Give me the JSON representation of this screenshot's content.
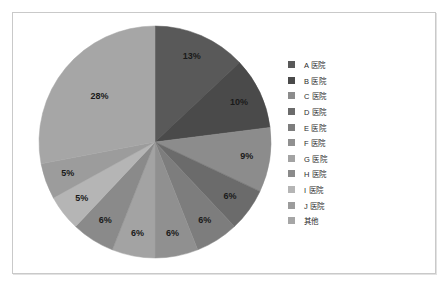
{
  "frame": {
    "border_color": "#c9c9c9",
    "background": "#ffffff"
  },
  "legend": {
    "position": "right",
    "items": [
      {
        "label": "A 医院",
        "color": "#595959"
      },
      {
        "label": "B 医院",
        "color": "#4a4a4a"
      },
      {
        "label": "C 医院",
        "color": "#8c8c8c"
      },
      {
        "label": "D 医院",
        "color": "#6b6b6b"
      },
      {
        "label": "E 医院",
        "color": "#7d7d7d"
      },
      {
        "label": "F 医院",
        "color": "#909090"
      },
      {
        "label": "G 医院",
        "color": "#a3a3a3"
      },
      {
        "label": "H 医院",
        "color": "#8a8a8a"
      },
      {
        "label": "I 医院",
        "color": "#b5b5b5"
      },
      {
        "label": "J 医院",
        "color": "#9c9c9c"
      },
      {
        "label": "其他",
        "color": "#a6a6a6"
      }
    ]
  },
  "chart_data": {
    "type": "pie",
    "title": "",
    "subtitle": "",
    "xlabel": "",
    "ylabel": "",
    "grid": false,
    "legend_position": "right",
    "start_angle_deg": 0,
    "direction": "clockwise",
    "value_unit": "%",
    "categories": [
      "A 医院",
      "B 医院",
      "C 医院",
      "D 医院",
      "E 医院",
      "F 医院",
      "G 医院",
      "H 医院",
      "I 医院",
      "J 医院",
      "其他"
    ],
    "values": [
      13,
      10,
      9,
      6,
      6,
      6,
      6,
      6,
      5,
      5,
      28
    ],
    "data_labels": [
      "13%",
      "10%",
      "9%",
      "6%",
      "6%",
      "6%",
      "6%",
      "6%",
      "5%",
      "5%",
      "28%"
    ],
    "colors": [
      "#595959",
      "#4a4a4a",
      "#8c8c8c",
      "#6b6b6b",
      "#7d7d7d",
      "#909090",
      "#a3a3a3",
      "#8a8a8a",
      "#b5b5b5",
      "#9c9c9c",
      "#a6a6a6"
    ]
  }
}
